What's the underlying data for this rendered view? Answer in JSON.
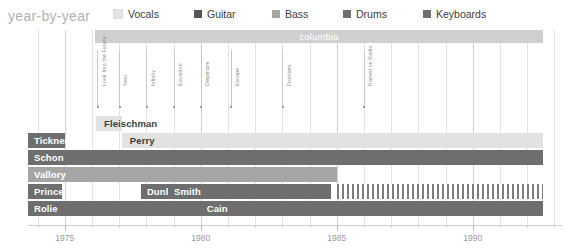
{
  "header": {
    "title": "year-by-year"
  },
  "legend": {
    "items": [
      {
        "label": "Vocals",
        "color": "#e2e2e2",
        "x": 0
      },
      {
        "label": "Guitar",
        "color": "#575757",
        "x": 81
      },
      {
        "label": "Bass",
        "color": "#a5a5a5",
        "x": 159
      },
      {
        "label": "Drums",
        "color": "#6e6e6e",
        "x": 230
      },
      {
        "label": "Keyboards",
        "color": "#6e6e6e",
        "x": 310
      }
    ]
  },
  "record_label": {
    "name": "columbia",
    "color": "#cfcfcf",
    "start_year": 1976.1,
    "end_year": 1992.6
  },
  "albums": [
    {
      "name": "Look Into the Future",
      "year": 1976.2
    },
    {
      "name": "Next",
      "year": 1977.0
    },
    {
      "name": "Infinity",
      "year": 1978.0
    },
    {
      "name": "Evolution",
      "year": 1979.0
    },
    {
      "name": "Departure",
      "year": 1980.0
    },
    {
      "name": "Escape",
      "year": 1981.1
    },
    {
      "name": "Frontiers",
      "year": 1983.0
    },
    {
      "name": "Raised on Radio",
      "year": 1986.0
    }
  ],
  "instrument_colors": {
    "vocals": "#e2e2e2",
    "guitar": "#575757",
    "bass": "#a5a5a5",
    "drums": "#6e6e6e",
    "keyboards": "#6e6e6e"
  },
  "members": [
    {
      "row": 0,
      "segments": [
        {
          "name": "Fleischman",
          "instrument": "vocals",
          "color": "#e2e2e2",
          "label_color": "#3d3d3d",
          "start_year": 1976.15,
          "end_year": 1977.1,
          "label_align": "after"
        }
      ]
    },
    {
      "row": 1,
      "segments": [
        {
          "name": "Tickner",
          "instrument": "guitar",
          "color": "#6e6e6e",
          "label_color": "#ffffff",
          "start_year": 1973.65,
          "end_year": 1975.0,
          "label_align": "inside"
        },
        {
          "name": "Perry",
          "instrument": "vocals",
          "color": "#e2e2e2",
          "label_color": "#3d3d3d",
          "start_year": 1977.1,
          "end_year": 1992.6,
          "label_align": "start"
        }
      ]
    },
    {
      "row": 2,
      "segments": [
        {
          "name": "Schon",
          "instrument": "guitar",
          "color": "#6e6e6e",
          "label_color": "#ffffff",
          "start_year": 1973.65,
          "end_year": 1992.6,
          "label_align": "inside"
        }
      ]
    },
    {
      "row": 3,
      "segments": [
        {
          "name": "Vallory",
          "instrument": "bass",
          "color": "#a5a5a5",
          "label_color": "#ffffff",
          "start_year": 1973.65,
          "end_year": 1985.0,
          "label_align": "inside"
        }
      ]
    },
    {
      "row": 4,
      "segments": [
        {
          "name": "Prince",
          "instrument": "drums",
          "color": "#6e6e6e",
          "label_color": "#ffffff",
          "start_year": 1973.65,
          "end_year": 1974.9,
          "label_align": "inside"
        },
        {
          "name": "Dunbar",
          "instrument": "drums",
          "color": "#6e6e6e",
          "label_color": "#ffffff",
          "start_year": 1977.8,
          "end_year": 1978.8,
          "label_align": "inside"
        },
        {
          "name": "Smith",
          "instrument": "drums",
          "color": "#6e6e6e",
          "label_color": "#ffffff",
          "start_year": 1978.8,
          "end_year": 1984.8,
          "label_align": "inside"
        }
      ],
      "striped": {
        "start_year": 1985.0,
        "end_year": 1992.6,
        "color": "#7d7d7d"
      }
    },
    {
      "row": 5,
      "segments": [
        {
          "name": "Rolie",
          "instrument": "keyboards",
          "color": "#6e6e6e",
          "label_color": "#ffffff",
          "start_year": 1973.65,
          "end_year": 1980.0,
          "label_align": "inside"
        },
        {
          "name": "Cain",
          "instrument": "keyboards",
          "color": "#6e6e6e",
          "label_color": "#ffffff",
          "start_year": 1980.0,
          "end_year": 1992.6,
          "label_align": "inside"
        }
      ]
    }
  ],
  "axis": {
    "year_labels": [
      "1975",
      "1980",
      "1985",
      "1990"
    ],
    "major_years": [
      1975,
      1980,
      1985,
      1990
    ],
    "tick_start": 1973.5,
    "tick_end": 1993.0,
    "px_per_year": 27.2,
    "origin_year": 1973.65
  },
  "chart_data": {
    "type": "bar",
    "title": "year-by-year",
    "xlabel": "",
    "ylabel": "",
    "xlim": [
      1973.5,
      1993.0
    ],
    "grid": true,
    "legend_position": "top",
    "categories": [
      "Fleischman",
      "Tickner",
      "Perry",
      "Schon",
      "Vallory",
      "Prince",
      "Dunbar",
      "Smith",
      "Rolie",
      "Cain"
    ],
    "series": [
      {
        "name": "Fleischman",
        "instrument": "Vocals",
        "start": 1976.15,
        "end": 1977.1
      },
      {
        "name": "Tickner",
        "instrument": "Guitar",
        "start": 1973.65,
        "end": 1975.0
      },
      {
        "name": "Perry",
        "instrument": "Vocals",
        "start": 1977.1,
        "end": 1992.6
      },
      {
        "name": "Schon",
        "instrument": "Guitar",
        "start": 1973.65,
        "end": 1992.6
      },
      {
        "name": "Vallory",
        "instrument": "Bass",
        "start": 1973.65,
        "end": 1985.0
      },
      {
        "name": "Prince",
        "instrument": "Drums",
        "start": 1973.65,
        "end": 1974.9
      },
      {
        "name": "Dunbar",
        "instrument": "Drums",
        "start": 1977.8,
        "end": 1978.8
      },
      {
        "name": "Smith",
        "instrument": "Drums",
        "start": 1978.8,
        "end": 1984.8
      },
      {
        "name": "Rolie",
        "instrument": "Keyboards",
        "start": 1973.65,
        "end": 1980.0
      },
      {
        "name": "Cain",
        "instrument": "Keyboards",
        "start": 1980.0,
        "end": 1992.6
      }
    ],
    "annotations": [
      {
        "label": "columbia",
        "type": "span",
        "start": 1976.1,
        "end": 1992.6
      },
      {
        "label": "Look Into the Future",
        "type": "event",
        "x": 1976.2
      },
      {
        "label": "Next",
        "type": "event",
        "x": 1977.0
      },
      {
        "label": "Infinity",
        "type": "event",
        "x": 1978.0
      },
      {
        "label": "Evolution",
        "type": "event",
        "x": 1979.0
      },
      {
        "label": "Departure",
        "type": "event",
        "x": 1980.0
      },
      {
        "label": "Escape",
        "type": "event",
        "x": 1981.1
      },
      {
        "label": "Frontiers",
        "type": "event",
        "x": 1983.0
      },
      {
        "label": "Raised on Radio",
        "type": "event",
        "x": 1986.0
      }
    ]
  }
}
